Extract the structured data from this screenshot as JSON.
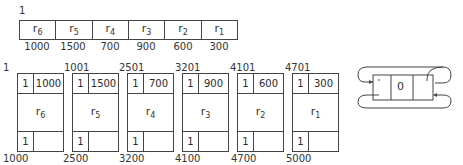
{
  "top_sequence": {
    "start_label": "1",
    "records": [
      {
        "name": "r",
        "sub": "6",
        "length": "1000"
      },
      {
        "name": "r",
        "sub": "5",
        "length": "1500"
      },
      {
        "name": "r",
        "sub": "4",
        "length": "700"
      },
      {
        "name": "r",
        "sub": "3",
        "length": "900"
      },
      {
        "name": "r",
        "sub": "2",
        "length": "600"
      },
      {
        "name": "r",
        "sub": "1",
        "length": "300"
      }
    ]
  },
  "blocks": [
    {
      "start": "1",
      "end": "1000",
      "head_flag": "1",
      "head_len": "1000",
      "name": "r",
      "sub": "6",
      "tail_flag": "1"
    },
    {
      "start": "1001",
      "end": "2500",
      "head_flag": "1",
      "head_len": "1500",
      "name": "r",
      "sub": "5",
      "tail_flag": "1"
    },
    {
      "start": "2501",
      "end": "3200",
      "head_flag": "1",
      "head_len": "700",
      "name": "r",
      "sub": "4",
      "tail_flag": "1"
    },
    {
      "start": "3201",
      "end": "4100",
      "head_flag": "1",
      "head_len": "900",
      "name": "r",
      "sub": "3",
      "tail_flag": "1"
    },
    {
      "start": "4101",
      "end": "4700",
      "head_flag": "1",
      "head_len": "600",
      "name": "r",
      "sub": "2",
      "tail_flag": "1"
    },
    {
      "start": "4701",
      "end": "5000",
      "head_flag": "1",
      "head_len": "300",
      "name": "r",
      "sub": "1",
      "tail_flag": "1"
    }
  ],
  "free_list_node": {
    "value": "0"
  }
}
